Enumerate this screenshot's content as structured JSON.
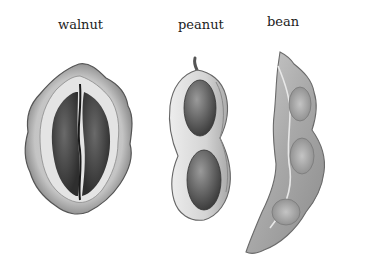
{
  "labels": {
    "walnut": "walnut",
    "peanut": "peanut",
    "bean": "bean"
  },
  "colors": {
    "background": "#ffffff",
    "label_text": "#222222",
    "shell_light": "#e6e6e6",
    "shell_mid": "#b8b8b8",
    "shell_dark": "#6e6e6e",
    "kernel_dark": "#3a3a3a",
    "seed_mid": "#5a5a5a"
  }
}
